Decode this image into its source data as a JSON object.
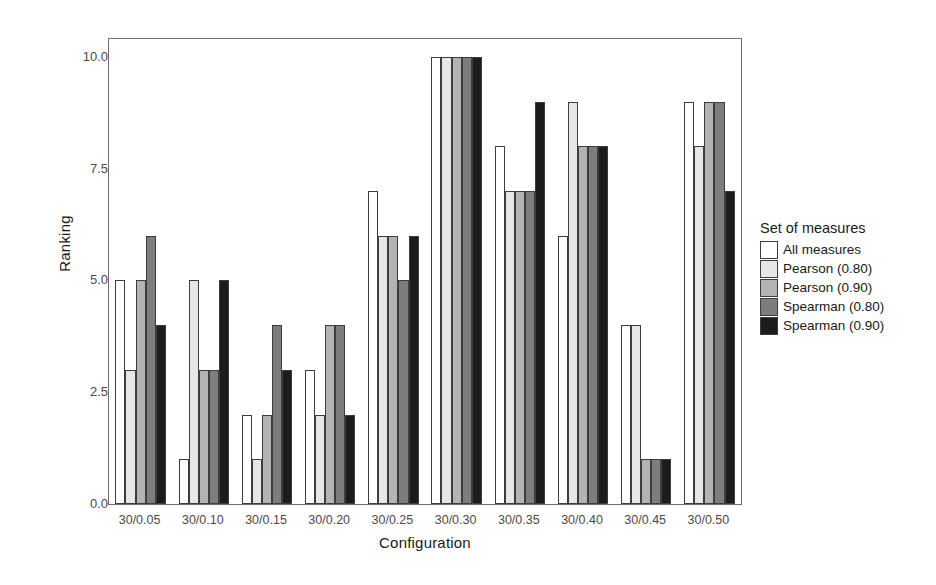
{
  "chart_data": {
    "type": "bar",
    "title": "",
    "xlabel": "Configuration",
    "ylabel": "Ranking",
    "grid": false,
    "ylim": [
      0,
      10.4
    ],
    "yticks": [
      "0.0",
      "2.5",
      "5.0",
      "7.5",
      "10.0"
    ],
    "ytick_values": [
      0,
      2.5,
      5,
      7.5,
      10
    ],
    "legend_position": "right",
    "legend_title": "Set of measures",
    "categories": [
      "30/0.05",
      "30/0.10",
      "30/0.15",
      "30/0.20",
      "30/0.25",
      "30/0.30",
      "30/0.35",
      "30/0.40",
      "30/0.45",
      "30/0.50"
    ],
    "series": [
      {
        "name": "All measures",
        "color": "#ffffff",
        "values": [
          5,
          1,
          2,
          3,
          7,
          10,
          8,
          6,
          4,
          9
        ]
      },
      {
        "name": "Pearson (0.80)",
        "color": "#e6e6e6",
        "values": [
          3,
          5,
          1,
          2,
          6,
          10,
          7,
          9,
          4,
          8
        ]
      },
      {
        "name": "Pearson (0.90)",
        "color": "#b3b3b3",
        "values": [
          5,
          3,
          2,
          4,
          6,
          10,
          7,
          8,
          1,
          9
        ]
      },
      {
        "name": "Spearman (0.80)",
        "color": "#7d7d7d",
        "values": [
          6,
          3,
          4,
          4,
          5,
          10,
          7,
          8,
          1,
          9
        ]
      },
      {
        "name": "Spearman (0.90)",
        "color": "#1c1c1c",
        "values": [
          4,
          5,
          3,
          2,
          6,
          10,
          9,
          8,
          1,
          7
        ]
      }
    ]
  }
}
